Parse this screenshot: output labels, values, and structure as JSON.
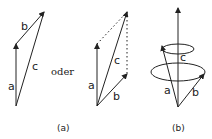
{
  "figure": {
    "connector_word": "oder",
    "panel_a": {
      "caption": "(a)",
      "triangle": {
        "labels": {
          "a": "a",
          "b": "b",
          "c": "c"
        }
      },
      "parallelogram": {
        "labels": {
          "a": "a",
          "b": "b",
          "c": "c"
        }
      }
    },
    "panel_b": {
      "caption": "(b)",
      "labels": {
        "a": "a",
        "b": "b",
        "c": "c"
      }
    },
    "colors": {
      "stroke": "#222222",
      "background": "#ffffff"
    }
  }
}
